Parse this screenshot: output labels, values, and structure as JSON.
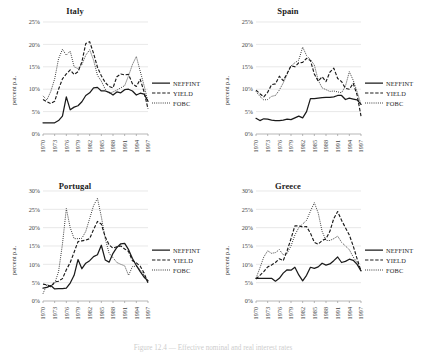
{
  "figure": {
    "caption": "Figure 12.4 — Effective nominal and real interest rates",
    "ylabel": "percent p.a.",
    "legend": [
      {
        "label": "NEFFINT",
        "style": "solid"
      },
      {
        "label": "YIELD",
        "style": "dashed"
      },
      {
        "label": "FOBC",
        "style": "dotted"
      }
    ]
  },
  "chart_data": [
    {
      "type": "line",
      "title": "Italy",
      "xlabel": "",
      "ylabel": "percent p.a.",
      "ylim": [
        0,
        25
      ],
      "yticks": [
        "0%",
        "5%",
        "10%",
        "15%",
        "20%",
        "25%"
      ],
      "ytick_values": [
        0,
        5,
        10,
        15,
        20,
        25
      ],
      "grid": true,
      "legend_position": "right",
      "x": [
        1970,
        1971,
        1972,
        1973,
        1974,
        1975,
        1976,
        1977,
        1978,
        1979,
        1980,
        1981,
        1982,
        1983,
        1984,
        1985,
        1986,
        1987,
        1988,
        1989,
        1990,
        1991,
        1992,
        1993,
        1994,
        1995,
        1996,
        1997
      ],
      "xticks": [
        "1970",
        "1973",
        "1976",
        "1979",
        "1982",
        "1985",
        "1988",
        "1991",
        "1994",
        "1997"
      ],
      "series": [
        {
          "name": "NEFFINT",
          "values": [
            2.5,
            2.5,
            2.5,
            2.5,
            3.0,
            4.0,
            8.3,
            5.4,
            6.0,
            6.3,
            7.2,
            8.6,
            9.2,
            10.3,
            10.4,
            9.6,
            9.6,
            9.3,
            8.7,
            9.4,
            9.2,
            9.9,
            10.0,
            9.6,
            8.7,
            9.1,
            8.9,
            7.3
          ]
        },
        {
          "name": "YIELD",
          "values": [
            7.7,
            7.2,
            6.8,
            7.3,
            10.0,
            12.3,
            13.4,
            14.3,
            13.3,
            13.9,
            16.1,
            20.2,
            20.6,
            18.0,
            14.9,
            13.0,
            11.5,
            10.6,
            10.3,
            12.8,
            13.4,
            13.2,
            13.3,
            11.2,
            10.6,
            12.2,
            9.4,
            5.6
          ]
        },
        {
          "name": "FOBC",
          "values": [
            8.5,
            7.6,
            9.5,
            12.3,
            16.8,
            18.9,
            17.6,
            18.5,
            15.0,
            14.6,
            15.5,
            17.6,
            18.8,
            16.5,
            13.1,
            11.8,
            10.0,
            9.0,
            9.4,
            9.8,
            10.3,
            10.8,
            13.0,
            15.5,
            17.3,
            14.0,
            10.8,
            7.2
          ]
        }
      ]
    },
    {
      "type": "line",
      "title": "Spain",
      "xlabel": "",
      "ylabel": "percent p.a.",
      "ylim": [
        0,
        25
      ],
      "yticks": [
        "0%",
        "5%",
        "10%",
        "15%",
        "20%",
        "25%"
      ],
      "ytick_values": [
        0,
        5,
        10,
        15,
        20,
        25
      ],
      "grid": true,
      "legend_position": "right",
      "x": [
        1970,
        1971,
        1972,
        1973,
        1974,
        1975,
        1976,
        1977,
        1978,
        1979,
        1980,
        1981,
        1982,
        1983,
        1984,
        1985,
        1986,
        1987,
        1988,
        1989,
        1990,
        1991,
        1992,
        1993,
        1994,
        1995,
        1996,
        1997
      ],
      "xticks": [
        "1970",
        "1973",
        "1976",
        "1979",
        "1982",
        "1985",
        "1988",
        "1991",
        "1994",
        "1997"
      ],
      "series": [
        {
          "name": "NEFFINT",
          "values": [
            3.5,
            3.0,
            3.4,
            3.3,
            3.1,
            3.0,
            3.0,
            3.1,
            3.3,
            3.2,
            3.6,
            4.0,
            3.6,
            5.0,
            7.9,
            7.9,
            8.0,
            8.1,
            8.2,
            8.2,
            8.3,
            8.6,
            8.6,
            7.7,
            8.0,
            7.8,
            7.6,
            6.6
          ]
        },
        {
          "name": "YIELD",
          "values": [
            9.8,
            9.0,
            8.3,
            9.3,
            11.0,
            11.2,
            12.9,
            11.9,
            13.5,
            15.2,
            15.0,
            15.9,
            16.0,
            16.9,
            16.4,
            13.4,
            11.8,
            12.8,
            11.7,
            13.8,
            14.7,
            12.4,
            11.7,
            10.2,
            10.0,
            11.3,
            8.7,
            4.0
          ]
        },
        {
          "name": "FOBC",
          "values": [
            9.5,
            8.4,
            7.6,
            7.7,
            8.4,
            8.6,
            9.8,
            11.4,
            13.3,
            15.2,
            15.9,
            16.5,
            19.4,
            17.5,
            16.6,
            15.4,
            12.0,
            10.3,
            9.9,
            9.5,
            9.6,
            9.4,
            9.2,
            10.7,
            13.9,
            12.0,
            9.4,
            6.6
          ]
        }
      ]
    },
    {
      "type": "line",
      "title": "Portugal",
      "xlabel": "",
      "ylabel": "percent p.a.",
      "ylim": [
        0,
        30
      ],
      "yticks": [
        "0%",
        "5%",
        "10%",
        "15%",
        "20%",
        "25%",
        "30%"
      ],
      "ytick_values": [
        0,
        5,
        10,
        15,
        20,
        25,
        30
      ],
      "grid": true,
      "legend_position": "right",
      "x": [
        1970,
        1971,
        1972,
        1973,
        1974,
        1975,
        1976,
        1977,
        1978,
        1979,
        1980,
        1981,
        1982,
        1983,
        1984,
        1985,
        1986,
        1987,
        1988,
        1989,
        1990,
        1991,
        1992,
        1993,
        1994,
        1995,
        1996,
        1997
      ],
      "xticks": [
        "1970",
        "1973",
        "1976",
        "1979",
        "1982",
        "1985",
        "1988",
        "1991",
        "1994",
        "1997"
      ],
      "series": [
        {
          "name": "NEFFINT",
          "values": [
            3.5,
            3.7,
            4.2,
            3.3,
            3.4,
            3.4,
            3.5,
            4.9,
            7.0,
            11.3,
            8.8,
            10.3,
            11.0,
            12.1,
            12.6,
            15.2,
            11.2,
            10.6,
            13.0,
            14.6,
            15.6,
            15.7,
            14.0,
            11.6,
            9.7,
            8.0,
            6.5,
            5.5
          ]
        },
        {
          "name": "YIELD",
          "values": [
            4.6,
            4.4,
            3.9,
            5.2,
            5.4,
            6.1,
            8.5,
            10.5,
            13.3,
            16.2,
            16.4,
            16.6,
            17.0,
            19.5,
            21.7,
            21.0,
            17.5,
            15.3,
            14.4,
            14.8,
            15.0,
            14.2,
            13.5,
            11.0,
            10.4,
            9.5,
            7.6,
            4.9
          ]
        },
        {
          "name": "FOBC",
          "values": [
            2.0,
            4.5,
            4.0,
            4.8,
            8.0,
            15.5,
            25.2,
            20.0,
            17.0,
            17.0,
            17.1,
            19.0,
            22.5,
            26.0,
            28.0,
            23.0,
            17.0,
            13.0,
            11.8,
            10.5,
            10.0,
            9.6,
            7.0,
            9.4,
            9.5,
            8.5,
            7.0,
            4.9
          ]
        }
      ]
    },
    {
      "type": "line",
      "title": "Greece",
      "xlabel": "",
      "ylabel": "percent p.a.",
      "ylim": [
        0,
        30
      ],
      "yticks": [
        "0%",
        "5%",
        "10%",
        "15%",
        "20%",
        "25%",
        "30%"
      ],
      "ytick_values": [
        0,
        5,
        10,
        15,
        20,
        25,
        30
      ],
      "grid": true,
      "legend_position": "right",
      "x": [
        1970,
        1971,
        1972,
        1973,
        1974,
        1975,
        1976,
        1977,
        1978,
        1979,
        1980,
        1981,
        1982,
        1983,
        1984,
        1985,
        1986,
        1987,
        1988,
        1989,
        1990,
        1991,
        1992,
        1993,
        1994,
        1995,
        1996,
        1997
      ],
      "xticks": [
        "1970",
        "1973",
        "1976",
        "1979",
        "1982",
        "1985",
        "1988",
        "1991",
        "1994",
        "1997"
      ],
      "series": [
        {
          "name": "NEFFINT",
          "values": [
            6.2,
            6.2,
            6.2,
            6.2,
            6.2,
            5.4,
            6.2,
            7.6,
            8.5,
            8.4,
            9.2,
            7.1,
            5.5,
            7.0,
            9.2,
            8.9,
            9.3,
            10.3,
            9.8,
            10.1,
            11.0,
            12.0,
            10.5,
            10.8,
            11.4,
            11.1,
            10.0,
            8.2
          ]
        },
        {
          "name": "YIELD",
          "values": [
            6.0,
            7.0,
            8.0,
            9.3,
            9.8,
            10.5,
            11.5,
            11.0,
            13.7,
            17.0,
            20.5,
            20.5,
            20.2,
            20.3,
            18.5,
            16.0,
            15.5,
            16.5,
            17.0,
            19.0,
            22.5,
            24.4,
            22.0,
            20.0,
            18.0,
            15.0,
            11.5,
            8.2
          ]
        },
        {
          "name": "FOBC",
          "values": [
            6.2,
            9.0,
            12.0,
            13.7,
            13.0,
            13.2,
            14.0,
            12.6,
            13.0,
            15.0,
            18.0,
            20.0,
            21.0,
            22.0,
            24.5,
            26.8,
            24.0,
            19.0,
            16.5,
            16.5,
            17.0,
            17.7,
            16.0,
            15.0,
            14.0,
            12.0,
            10.5,
            8.2
          ]
        }
      ]
    }
  ]
}
